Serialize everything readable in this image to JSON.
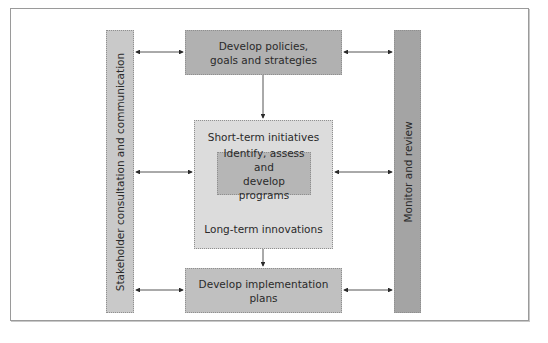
{
  "diagram": {
    "left_bar": {
      "label": "Stakeholder consultation and communication",
      "color": "#c9c9c9"
    },
    "right_bar": {
      "label": "Monitor and review",
      "color": "#a4a4a4"
    },
    "top_box": {
      "line1": "Develop policies,",
      "line2": "goals and strategies",
      "color": "#b1b1b1"
    },
    "middle_box": {
      "top_label": "Short-term initiatives",
      "bottom_label": "Long-term innovations",
      "color": "#dcdcdc",
      "inner_box": {
        "line1": "Identify, assess and",
        "line2": "develop programs",
        "color": "#b6b6b6"
      }
    },
    "bottom_box": {
      "label": "Develop implementation plans",
      "color": "#c0c0c0"
    },
    "connections": [
      {
        "from": "top_box",
        "to": "middle_box",
        "type": "one-way"
      },
      {
        "from": "middle_box",
        "to": "bottom_box",
        "type": "one-way"
      },
      {
        "from": "left_bar",
        "to": "top_box",
        "type": "two-way"
      },
      {
        "from": "left_bar",
        "to": "middle_box",
        "type": "two-way"
      },
      {
        "from": "left_bar",
        "to": "bottom_box",
        "type": "two-way"
      },
      {
        "from": "top_box",
        "to": "right_bar",
        "type": "two-way"
      },
      {
        "from": "middle_box",
        "to": "right_bar",
        "type": "two-way"
      },
      {
        "from": "bottom_box",
        "to": "right_bar",
        "type": "two-way"
      }
    ]
  }
}
